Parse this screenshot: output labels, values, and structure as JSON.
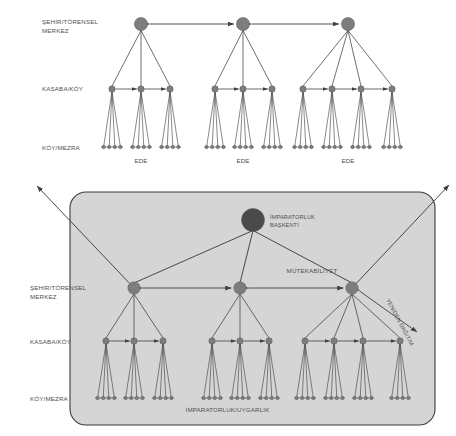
{
  "figure": {
    "title": "",
    "background": "#ffffff",
    "panel_fill": "#d5d5d5",
    "panel_stroke": "#3a3a3a",
    "node_fill": "#7d7d7d",
    "node_stroke": "#5d5d5d",
    "capital_fill": "#4a4a4a",
    "line_color": "#3f3f3f",
    "text_color": "#4f4f4f"
  },
  "top_diagram": {
    "name": "pre-imperial-settlement-hierarchy",
    "tier_labels": [
      {
        "id": "tier-1",
        "text": "ŞEHİR/TÖRENSEL",
        "text2": "MERKEZ"
      },
      {
        "id": "tier-2",
        "text": "KASABA/KÖY"
      },
      {
        "id": "tier-3",
        "text": "KÖY/MEZRA"
      }
    ],
    "cluster_labels": [
      "EDE",
      "EDE",
      "EDE"
    ],
    "clusters": [
      {
        "hub_x": 141,
        "mid_count": 3,
        "mid_xs": [
          112,
          141,
          170
        ],
        "leaves_per_mid": 4
      },
      {
        "hub_x": 243,
        "mid_count": 3,
        "mid_xs": [
          215,
          243,
          272
        ],
        "leaves_per_mid": 4
      },
      {
        "hub_x": 348,
        "mid_count": 4,
        "mid_xs": [
          303,
          332,
          361,
          392
        ],
        "leaves_per_mid": 4
      }
    ],
    "rows": {
      "hub_y": 24,
      "mid_y": 89,
      "leaf_y": 147,
      "cluster_label_y": 159
    },
    "reciprocity_arrows": [
      {
        "from_x": 141,
        "to_x": 243,
        "y": 24,
        "double": true
      },
      {
        "from_x": 243,
        "to_x": 348,
        "y": 24,
        "double": true
      }
    ]
  },
  "bottom_diagram": {
    "name": "imperial-settlement-hierarchy",
    "panel": {
      "x": 70,
      "y": 192,
      "width": 365,
      "height": 233,
      "radius": 16
    },
    "panel_caption": "İMPARATORLUK/UYGARLIK",
    "capital": {
      "x": 253,
      "y": 220,
      "r": 11.5,
      "label_line1": "İMPARATORLUK",
      "label_line2": "BAŞKENTİ"
    },
    "tier_labels": [
      {
        "id": "tier-1",
        "text": "ŞEHİR/TÖRENSEL",
        "text2": "MERKEZ"
      },
      {
        "id": "tier-2",
        "text": "KASABA/KÖY"
      },
      {
        "id": "tier-3",
        "text": "KÖY/MEZRA"
      }
    ],
    "annotations": [
      {
        "id": "reciprocity",
        "text": "MÜTEKABİLİYET",
        "x": 312,
        "y": 273
      },
      {
        "id": "redistribution",
        "text": "YENİDEN DAĞITIM",
        "x": 386,
        "y": 300,
        "rotation": 62
      }
    ],
    "clusters": [
      {
        "hub_x": 134,
        "mid_xs": [
          106,
          134,
          163
        ],
        "leaves_per_mid": 4
      },
      {
        "hub_x": 240,
        "mid_xs": [
          212,
          240,
          269
        ],
        "leaves_per_mid": 4
      },
      {
        "hub_x": 352,
        "mid_xs": [
          305,
          334,
          363,
          400
        ],
        "leaves_per_mid": 4
      }
    ],
    "rows": {
      "hub_y": 288,
      "mid_y": 341,
      "leaf_y": 398
    },
    "reciprocity_arrows": [
      {
        "from_x": 134,
        "to_x": 240,
        "y": 288,
        "double": true
      },
      {
        "from_x": 240,
        "to_x": 352,
        "y": 288,
        "double": true
      }
    ],
    "external_arrows": [
      {
        "id": "external-arrow-left",
        "from_x": 134,
        "from_y": 288,
        "to_x": 37,
        "to_y": 186
      },
      {
        "id": "external-arrow-right",
        "from_x": 352,
        "from_y": 288,
        "to_x": 449,
        "to_y": 185
      }
    ]
  }
}
